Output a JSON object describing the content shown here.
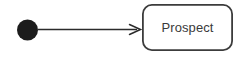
{
  "diagram": {
    "type": "uml-state-diagram",
    "background_color": "#ffffff",
    "width": 241,
    "height": 57,
    "nodes": [
      {
        "id": "initial",
        "kind": "initial-state",
        "shape": "filled-circle",
        "label": "",
        "fill_color": "#1c1c1c",
        "cx": 27.5,
        "cy": 30,
        "r": 10.5
      },
      {
        "id": "prospect",
        "kind": "state",
        "shape": "rounded-rectangle",
        "label": "Prospect",
        "stroke_color": "#3c3c3c",
        "fill_color": "#ffffff",
        "text_color": "#3a3a3a",
        "x": 142,
        "y": 4,
        "width": 91,
        "height": 47,
        "corner_radius": 9,
        "stroke_width": 1.8
      }
    ],
    "edges": [
      {
        "id": "initial-to-prospect",
        "from": "initial",
        "to": "prospect",
        "label": "",
        "stroke_color": "#2b2b2b",
        "stroke_width": 1.4,
        "arrowhead": "open-v",
        "x1": 38,
        "y1": 29.5,
        "x2": 141,
        "y2": 29.5
      }
    ]
  }
}
